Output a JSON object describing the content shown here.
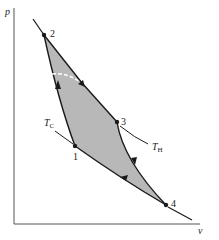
{
  "diagram": {
    "axes": {
      "y_label": "p",
      "x_label": "v"
    },
    "points": [
      {
        "id": "1",
        "label": "1"
      },
      {
        "id": "2",
        "label": "2"
      },
      {
        "id": "3",
        "label": "3"
      },
      {
        "id": "4",
        "label": "4"
      }
    ],
    "isotherms": {
      "cold": {
        "label_main": "T",
        "label_sub": "C"
      },
      "hot": {
        "label_main": "T",
        "label_sub": "H"
      }
    },
    "colors": {
      "fill": "#b8b8b8",
      "line": "#1a1a1a",
      "axis": "#555555"
    }
  }
}
